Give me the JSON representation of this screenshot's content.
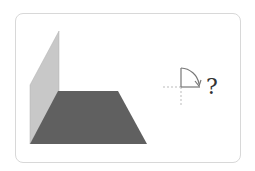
{
  "figure": {
    "question_mark": "?",
    "colors": {
      "vertical_plane": "#c8c8c8",
      "horizontal_plane": "#606060",
      "rotation_symbol": "#777777",
      "dashed_axes": "#bbbbbb",
      "card_border": "#d8d8d8"
    },
    "rotation_symbol": "quarter-circle-clockwise-arrow"
  }
}
